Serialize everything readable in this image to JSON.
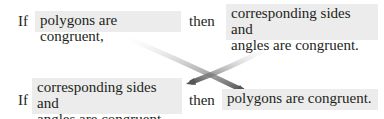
{
  "statement": {
    "if_label": "If",
    "hypothesis": "polygons are congruent,",
    "then_label": "then",
    "conclusion_line1": "corresponding sides and",
    "conclusion_line2": "angles are congruent."
  },
  "converse": {
    "if_label": "If",
    "hypothesis_line1": "corresponding sides and",
    "hypothesis_line2": "angles are congruent,",
    "then_label": "then",
    "conclusion": "polygons are congruent."
  },
  "colors": {
    "box_fill": "#ececec",
    "text": "#231f20",
    "arrow": "#5a5a5a"
  }
}
